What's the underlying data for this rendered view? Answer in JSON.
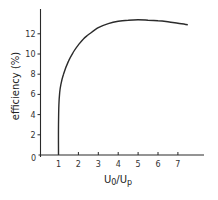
{
  "chart_data": {
    "type": "line",
    "title": "",
    "xlabel": "U0/Up",
    "ylabel": "efficiency (%)",
    "xlim": [
      0,
      8.2
    ],
    "ylim": [
      0,
      14.5
    ],
    "x_ticks": [
      1,
      2,
      3,
      4,
      5,
      6,
      7
    ],
    "x_tick_labels": [
      "1",
      "2",
      "3",
      "4",
      "5",
      "6",
      "7"
    ],
    "y_ticks": [
      2,
      4,
      6,
      8,
      10,
      12
    ],
    "y_tick_labels": [
      "2",
      "4",
      "6",
      "8",
      "10",
      "12"
    ],
    "origin_label": "0",
    "grid": false,
    "legend": null,
    "series": [
      {
        "name": "efficiency",
        "x": [
          1.0,
          1.0,
          1.02,
          1.06,
          1.12,
          1.25,
          1.5,
          1.75,
          2.0,
          2.25,
          2.5,
          3.0,
          3.5,
          4.0,
          4.5,
          5.0,
          5.5,
          6.0,
          6.5,
          7.0,
          7.5
        ],
        "y": [
          0.0,
          3.0,
          5.0,
          6.2,
          7.0,
          8.0,
          9.3,
          10.2,
          10.9,
          11.5,
          11.9,
          12.6,
          13.0,
          13.25,
          13.35,
          13.4,
          13.35,
          13.3,
          13.2,
          13.05,
          12.9
        ]
      }
    ]
  }
}
